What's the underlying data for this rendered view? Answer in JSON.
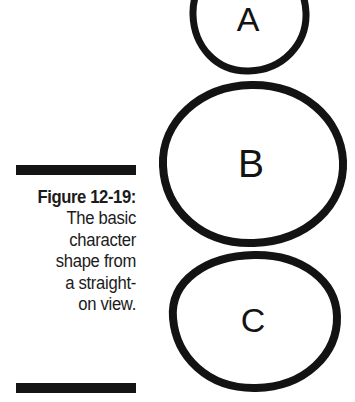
{
  "page": {
    "background_color": "#ffffff",
    "ink_color": "#131313",
    "width": 355,
    "height": 402
  },
  "caption": {
    "label": "Figure 12-19:",
    "lines": [
      "The basic",
      "character",
      "shape from",
      "a straight-",
      "on view."
    ],
    "full_text": "Figure 12-19: The basic character shape from a straight-on view.",
    "rule_color": "#141414"
  },
  "diagram": {
    "shapes": [
      {
        "id": "shape-a",
        "letter": "A",
        "role": "head",
        "size": "small",
        "center_x": 248,
        "center_y": 13,
        "radius_x": 56,
        "radius_y": 58,
        "stroke_width": 7
      },
      {
        "id": "shape-b",
        "letter": "B",
        "role": "torso",
        "size": "large",
        "center_x": 252,
        "center_y": 163,
        "radius_x": 89,
        "radius_y": 79,
        "stroke_width": 8
      },
      {
        "id": "shape-c",
        "letter": "C",
        "role": "hips",
        "size": "medium",
        "center_x": 253,
        "center_y": 321,
        "radius_x": 82,
        "radius_y": 67,
        "stroke_width": 8
      }
    ]
  }
}
